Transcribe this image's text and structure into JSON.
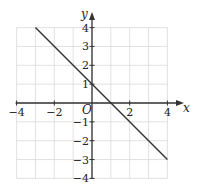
{
  "chart_data": {
    "type": "line",
    "title": "",
    "xlabel": "x",
    "ylabel": "y",
    "xlim": [
      -4,
      4
    ],
    "ylim": [
      -4,
      4
    ],
    "grid": true,
    "x_ticks": [
      -4,
      -2,
      2,
      4
    ],
    "y_ticks": [
      4,
      3,
      2,
      1,
      -1,
      -2,
      -3,
      -4
    ],
    "origin_label": "O",
    "series": [
      {
        "name": "y = -x + 1",
        "x": [
          -3,
          4
        ],
        "y": [
          4,
          -3
        ]
      }
    ]
  },
  "labels": {
    "x_axis": "x",
    "y_axis": "y",
    "origin": "O",
    "x_ticks": [
      "−4",
      "−2",
      "2",
      "4"
    ],
    "y_ticks": [
      "4",
      "3",
      "2",
      "1",
      "−1",
      "−2",
      "−3",
      "−4"
    ]
  },
  "colors": {
    "grid": "#d9d9d9",
    "axis": "#333333",
    "line": "#333333"
  }
}
